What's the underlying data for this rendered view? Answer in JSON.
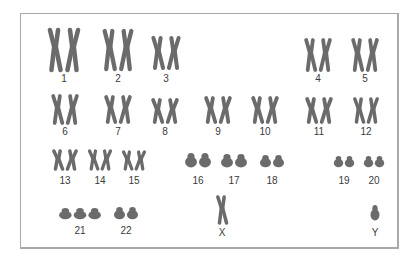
{
  "figure": {
    "type": "karyotype",
    "chromosome_color": "#6b6b6b",
    "label_color": "#3a3a3a",
    "frame_color": "#a9a9a9"
  },
  "chromosomes": [
    {
      "label": "1",
      "copies": 2,
      "x": 64,
      "y": 30,
      "h": 40,
      "w": 36,
      "lx": 64,
      "ly": 74
    },
    {
      "label": "2",
      "copies": 2,
      "x": 118,
      "y": 31,
      "h": 38,
      "w": 34,
      "lx": 118,
      "ly": 74
    },
    {
      "label": "3",
      "copies": 2,
      "x": 166,
      "y": 38,
      "h": 30,
      "w": 32,
      "lx": 166,
      "ly": 74
    },
    {
      "label": "4",
      "copies": 2,
      "x": 318,
      "y": 40,
      "h": 30,
      "w": 30,
      "lx": 318,
      "ly": 74
    },
    {
      "label": "5",
      "copies": 2,
      "x": 365,
      "y": 40,
      "h": 30,
      "w": 30,
      "lx": 365,
      "ly": 74
    },
    {
      "label": "6",
      "copies": 2,
      "x": 65,
      "y": 96,
      "h": 27,
      "w": 30,
      "lx": 65,
      "ly": 127
    },
    {
      "label": "7",
      "copies": 2,
      "x": 118,
      "y": 97,
      "h": 25,
      "w": 30,
      "lx": 118,
      "ly": 127
    },
    {
      "label": "8",
      "copies": 2,
      "x": 165,
      "y": 100,
      "h": 22,
      "w": 30,
      "lx": 165,
      "ly": 127
    },
    {
      "label": "9",
      "copies": 2,
      "x": 218,
      "y": 98,
      "h": 24,
      "w": 30,
      "lx": 218,
      "ly": 127
    },
    {
      "label": "10",
      "copies": 2,
      "x": 265,
      "y": 98,
      "h": 24,
      "w": 30,
      "lx": 265,
      "ly": 127
    },
    {
      "label": "11",
      "copies": 2,
      "x": 319,
      "y": 99,
      "h": 23,
      "w": 30,
      "lx": 319,
      "ly": 127
    },
    {
      "label": "12",
      "copies": 2,
      "x": 366,
      "y": 99,
      "h": 23,
      "w": 28,
      "lx": 366,
      "ly": 127
    },
    {
      "label": "13",
      "copies": 2,
      "x": 65,
      "y": 151,
      "h": 18,
      "w": 28,
      "lx": 65,
      "ly": 176
    },
    {
      "label": "14",
      "copies": 2,
      "x": 100,
      "y": 151,
      "h": 18,
      "w": 26,
      "lx": 100,
      "ly": 176
    },
    {
      "label": "15",
      "copies": 2,
      "x": 134,
      "y": 152,
      "h": 17,
      "w": 26,
      "lx": 134,
      "ly": 176
    },
    {
      "label": "16",
      "copies": 2,
      "x": 198,
      "y": 153,
      "h": 14,
      "w": 28,
      "lx": 198,
      "ly": 176
    },
    {
      "label": "17",
      "copies": 2,
      "x": 234,
      "y": 154,
      "h": 13,
      "w": 28,
      "lx": 234,
      "ly": 176
    },
    {
      "label": "18",
      "copies": 2,
      "x": 272,
      "y": 155,
      "h": 12,
      "w": 26,
      "lx": 272,
      "ly": 176
    },
    {
      "label": "19",
      "copies": 2,
      "x": 344,
      "y": 156,
      "h": 11,
      "w": 22,
      "lx": 344,
      "ly": 176
    },
    {
      "label": "20",
      "copies": 2,
      "x": 374,
      "y": 156,
      "h": 11,
      "w": 22,
      "lx": 374,
      "ly": 176
    },
    {
      "label": "21",
      "copies": 3,
      "x": 80,
      "y": 208,
      "h": 11,
      "w": 44,
      "lx": 80,
      "ly": 226
    },
    {
      "label": "22",
      "copies": 2,
      "x": 126,
      "y": 207,
      "h": 12,
      "w": 26,
      "lx": 126,
      "ly": 226
    },
    {
      "label": "X",
      "copies": 1,
      "x": 222,
      "y": 197,
      "h": 26,
      "w": 14,
      "lx": 222,
      "ly": 228
    },
    {
      "label": "Y",
      "copies": 1,
      "x": 375,
      "y": 205,
      "h": 15,
      "w": 9,
      "lx": 375,
      "ly": 228
    }
  ]
}
